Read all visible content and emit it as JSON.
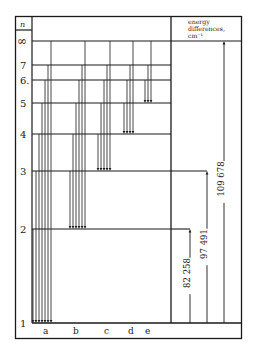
{
  "header": {
    "n_label": "n",
    "energy_header": [
      "energy",
      "differences,",
      "cm⁻¹"
    ]
  },
  "levels": [
    {
      "n": "∞",
      "y": 41
    },
    {
      "n": "7",
      "y": 65
    },
    {
      "n": "6.",
      "y": 80
    },
    {
      "n": "5",
      "y": 103
    },
    {
      "n": "4",
      "y": 134
    },
    {
      "n": "3",
      "y": 171
    },
    {
      "n": "2",
      "y": 229
    },
    {
      "n": "1",
      "y": 323
    }
  ],
  "series": [
    {
      "label": "a",
      "label_x": 43,
      "lower_level_y": 323,
      "x": [
        33,
        36,
        39,
        42,
        45,
        48,
        51
      ],
      "upper_y": [
        229,
        171,
        134,
        103,
        80,
        65,
        41
      ]
    },
    {
      "label": "b",
      "label_x": 73,
      "lower_level_y": 229,
      "x": [
        70,
        73,
        76,
        79,
        82,
        85
      ],
      "upper_y": [
        171,
        134,
        103,
        80,
        65,
        41
      ]
    },
    {
      "label": "c",
      "label_x": 104,
      "lower_level_y": 171,
      "x": [
        98,
        101,
        104,
        107,
        110
      ],
      "upper_y": [
        134,
        103,
        80,
        65,
        41
      ]
    },
    {
      "label": "d",
      "label_x": 128,
      "lower_level_y": 134,
      "x": [
        124,
        127,
        130,
        133
      ],
      "upper_y": [
        103,
        80,
        65,
        41
      ]
    },
    {
      "label": "e",
      "label_x": 145,
      "lower_level_y": 103,
      "x": [
        145,
        148,
        151
      ],
      "upper_y": [
        80,
        65,
        41
      ]
    }
  ],
  "energy_differences": [
    {
      "label": "82 258",
      "x": 190,
      "from_y": 323,
      "to_y": 229
    },
    {
      "label": "97 491",
      "x": 207,
      "from_y": 323,
      "to_y": 171
    },
    {
      "label": "109 678",
      "x": 224,
      "from_y": 323,
      "to_y": 41
    }
  ]
}
